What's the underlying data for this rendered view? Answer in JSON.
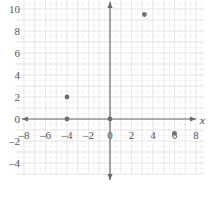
{
  "chart_data": {
    "type": "scatter",
    "title": "",
    "xlabel": "x",
    "ylabel": "",
    "xlim": [
      -8.8,
      8.8
    ],
    "ylim": [
      -5.0,
      11.0
    ],
    "xticks": [
      -8,
      -6,
      -4,
      -2,
      0,
      2,
      4,
      6,
      8
    ],
    "xtick_labels": [
      "-8",
      "-6",
      "-4",
      "-2",
      "0",
      "2",
      "4",
      "6",
      "8"
    ],
    "yticks": [
      -4,
      -2,
      0,
      2,
      4,
      6,
      8,
      10
    ],
    "ytick_labels": [
      "-4",
      "-2",
      "0",
      "2",
      "4",
      "6",
      "8",
      "10"
    ],
    "grid": true,
    "grid_minor": true,
    "grid_minor_step": 0.5,
    "legend": "none",
    "points": [
      {
        "x": -4,
        "y": 2
      },
      {
        "x": -4,
        "y": 0
      },
      {
        "x": 0,
        "y": 0
      },
      {
        "x": 3.2,
        "y": 9.5
      },
      {
        "x": 6,
        "y": -1.3
      }
    ],
    "point_color": "#707070",
    "axis_color": "#6b6b6b",
    "grid_color": "#e8e4e4",
    "grid_minor_color": "#f2efef"
  },
  "axes": {
    "x_axis_label": "x",
    "y_axis_label": ""
  }
}
